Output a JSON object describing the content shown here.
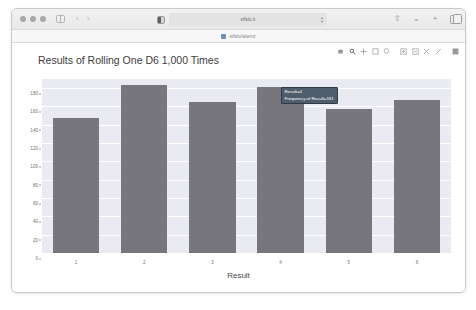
{
  "browser": {
    "window_controls": [
      "close",
      "minimize",
      "maximize"
    ],
    "sidebar_toggle_label": "Show Sidebar",
    "back_label": "‹",
    "forward_label": "›",
    "url": "stfslo.it",
    "url_placeholder": "Search or enter website name",
    "bookmark_label": "stfslo/sitemz",
    "right_icons": [
      "share-icon",
      "downloads-icon",
      "new-tab-icon",
      "tab-overview-icon"
    ]
  },
  "modebar": {
    "buttons": [
      "camera-icon",
      "zoom-icon",
      "pan-icon",
      "zoom-box-icon",
      "lasso-icon",
      "zoom-in-icon",
      "zoom-out-icon",
      "autoscale-icon",
      "reset-axes-icon",
      "plotly-logo-icon"
    ]
  },
  "chart_data": {
    "type": "bar",
    "title": "Results of Rolling One D6 1,000 Times",
    "xlabel": "Result",
    "ylabel": "Frequency of Result",
    "categories": [
      "1",
      "2",
      "3",
      "4",
      "5",
      "6"
    ],
    "values": [
      147,
      183,
      165,
      181,
      157,
      167
    ],
    "ylim": [
      0,
      190
    ],
    "yticks": [
      0,
      20,
      40,
      60,
      80,
      100,
      120,
      140,
      160,
      180
    ],
    "grid": true,
    "legend": "none",
    "bar_color": "#76767c",
    "plot_bg": "#eaeaf2"
  },
  "tooltip": {
    "line1": "Result=4",
    "line2": "Frequency of Result=181",
    "bg_color": "#4e5d6c"
  }
}
